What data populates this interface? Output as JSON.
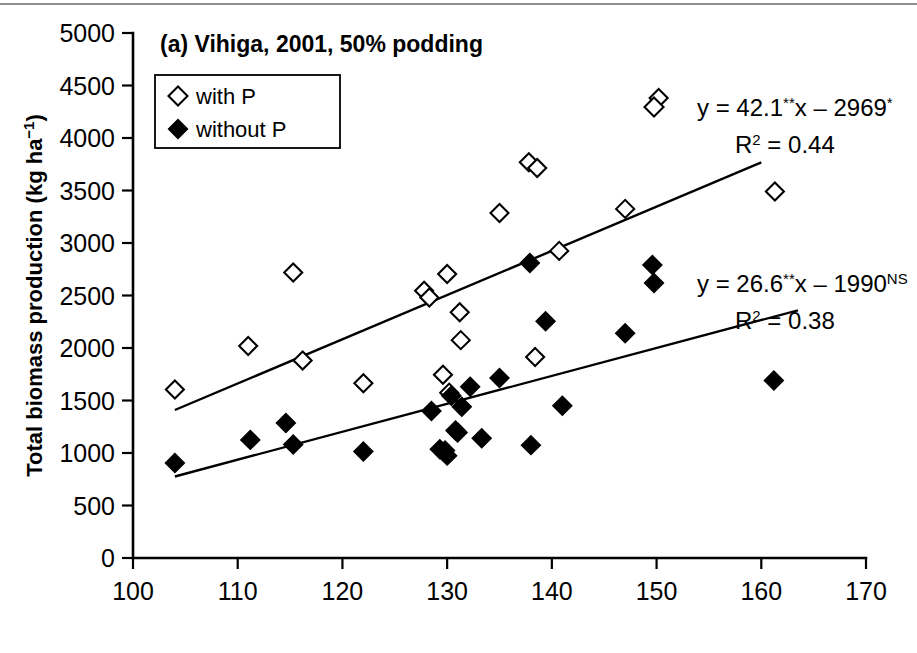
{
  "figure": {
    "panel_title": "(a) Vihiga, 2001, 50% podding",
    "background": "#ffffff",
    "foreground": "#000000",
    "top_rule_color": "#8e8e8e"
  },
  "legend": {
    "position": "upper-left-inside",
    "items": [
      {
        "marker": "open-diamond",
        "label": "with P"
      },
      {
        "marker": "filled-diamond",
        "label": "without P"
      }
    ]
  },
  "annotations": {
    "with_p": {
      "marker": "open-diamond",
      "equation_prefix": "y = 42.1",
      "equation_sig1": "**",
      "equation_mid": "x – 2969",
      "equation_sig2": "*",
      "r2_prefix": "R",
      "r2_exp": "2",
      "r2_value": " = 0.44"
    },
    "without_p": {
      "marker": "filled-diamond",
      "equation_prefix": "y = 26.6",
      "equation_sig1": "**",
      "equation_mid": "x – 1990",
      "equation_sig2": "NS",
      "r2_prefix": "R",
      "r2_exp": "2",
      "r2_value": " = 0.38"
    }
  },
  "chart_data": {
    "type": "scatter",
    "title": "(a) Vihiga, 2001, 50% podding",
    "xlabel": "",
    "ylabel": "Total biomass production (kg ha⁻¹)",
    "ylabel_base": "Total biomass production (kg ha",
    "ylabel_sup": "−1",
    "ylabel_tail": ")",
    "xlim": [
      100,
      170
    ],
    "ylim": [
      0,
      5000
    ],
    "xticks": [
      100,
      110,
      120,
      130,
      140,
      150,
      160,
      170
    ],
    "yticks": [
      0,
      500,
      1000,
      1500,
      2000,
      2500,
      3000,
      3500,
      4000,
      4500,
      5000
    ],
    "grid": false,
    "legend_position": "upper left",
    "series": [
      {
        "name": "with P",
        "marker": "open-diamond",
        "color": "#000000",
        "fill": "#ffffff",
        "points": [
          [
            104.0,
            1605
          ],
          [
            111.0,
            2020
          ],
          [
            115.3,
            2720
          ],
          [
            116.2,
            1880
          ],
          [
            122.0,
            1665
          ],
          [
            127.8,
            2545
          ],
          [
            128.3,
            2480
          ],
          [
            129.6,
            1745
          ],
          [
            130.0,
            2705
          ],
          [
            130.2,
            1575
          ],
          [
            131.2,
            2340
          ],
          [
            131.3,
            2075
          ],
          [
            135.0,
            3285
          ],
          [
            137.8,
            3770
          ],
          [
            138.6,
            3715
          ],
          [
            138.4,
            1915
          ],
          [
            140.7,
            2925
          ],
          [
            147.0,
            3325
          ],
          [
            150.2,
            4380
          ],
          [
            161.3,
            3490
          ]
        ],
        "fit": {
          "slope": 42.1,
          "intercept": -2969,
          "r2": 0.44,
          "x_start": 104.0,
          "x_end": 160.0
        }
      },
      {
        "name": "without P",
        "marker": "filled-diamond",
        "color": "#000000",
        "fill": "#000000",
        "points": [
          [
            104.0,
            905
          ],
          [
            111.2,
            1125
          ],
          [
            114.6,
            1285
          ],
          [
            115.3,
            1080
          ],
          [
            122.0,
            1015
          ],
          [
            128.5,
            1400
          ],
          [
            129.3,
            1035
          ],
          [
            129.8,
            1025
          ],
          [
            130.0,
            975
          ],
          [
            130.4,
            1545
          ],
          [
            130.8,
            1215
          ],
          [
            131.0,
            1195
          ],
          [
            131.4,
            1440
          ],
          [
            132.2,
            1630
          ],
          [
            133.3,
            1140
          ],
          [
            135.0,
            1715
          ],
          [
            137.9,
            2810
          ],
          [
            138.0,
            1075
          ],
          [
            139.4,
            2255
          ],
          [
            141.0,
            1450
          ],
          [
            147.0,
            2140
          ],
          [
            149.6,
            2790
          ],
          [
            161.2,
            1690
          ]
        ],
        "fit": {
          "slope": 26.6,
          "intercept": -1990,
          "r2": 0.38,
          "x_start": 104.0,
          "x_end": 163.5
        }
      }
    ]
  }
}
